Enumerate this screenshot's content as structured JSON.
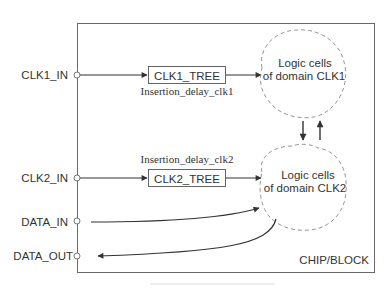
{
  "diagram": {
    "block_label": "CHIP/BLOCK",
    "ports": [
      {
        "id": "clk1_in",
        "label": "CLK1_IN",
        "direction": "input"
      },
      {
        "id": "clk2_in",
        "label": "CLK2_IN",
        "direction": "input"
      },
      {
        "id": "data_in",
        "label": "DATA_IN",
        "direction": "input"
      },
      {
        "id": "data_out",
        "label": "DATA_OUT",
        "direction": "output"
      }
    ],
    "clock_trees": [
      {
        "id": "clk1_tree",
        "label": "CLK1_TREE",
        "annotation": "Insertion_delay_clk1"
      },
      {
        "id": "clk2_tree",
        "label": "CLK2_TREE",
        "annotation": "Insertion_delay_clk2"
      }
    ],
    "logic_clouds": [
      {
        "id": "clk1_domain",
        "line1": "Logic cells",
        "line2": "of domain CLK1"
      },
      {
        "id": "clk2_domain",
        "line1": "Logic cells",
        "line2": "of domain CLK2"
      }
    ],
    "colors": {
      "line": "#3a3a3a",
      "frame": "#6a6a6a",
      "cloud": "#8a8a8a",
      "text": "#333333"
    }
  }
}
